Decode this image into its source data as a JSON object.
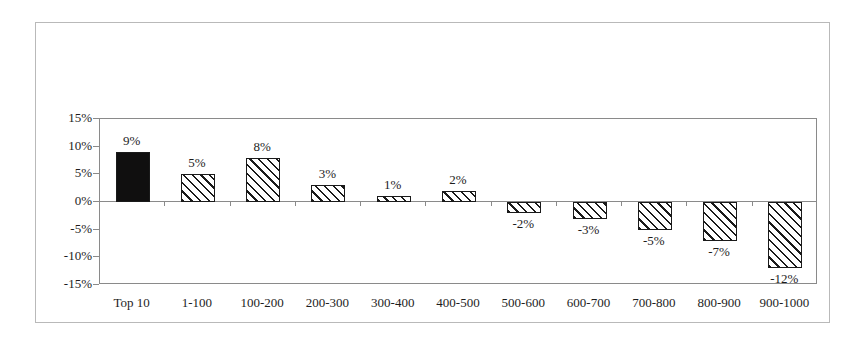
{
  "chart_data": {
    "type": "bar",
    "title": "",
    "subtitle": "",
    "xlabel": "",
    "ylabel": "",
    "categories": [
      "Top 10",
      "1-100",
      "100-200",
      "200-300",
      "300-400",
      "400-500",
      "500-600",
      "600-700",
      "700-800",
      "800-900",
      "900-1000"
    ],
    "values": [
      9,
      5,
      8,
      3,
      1,
      2,
      -2,
      -3,
      -5,
      -7,
      -12
    ],
    "data_labels": [
      "9%",
      "5%",
      "8%",
      "3%",
      "1%",
      "2%",
      "-2%",
      "-3%",
      "-5%",
      "-7%",
      "-12%"
    ],
    "value_unit": "%",
    "ylim": [
      -15,
      15
    ],
    "ytick_values": [
      15,
      10,
      5,
      0,
      -5,
      -10,
      -15
    ],
    "ytick_labels": [
      "15%",
      "10%",
      "5%",
      "0%",
      "-5%",
      "-10%",
      "-15%"
    ],
    "grid": false,
    "legend": null,
    "legend_position": "none",
    "bar_styles": [
      "solid",
      "hatch",
      "hatch",
      "hatch",
      "hatch",
      "hatch",
      "hatch",
      "hatch",
      "hatch",
      "hatch",
      "hatch"
    ],
    "colors": {
      "solid_fill": "#100f0f",
      "hatch_line": "#1a1a1a",
      "hatch_background": "#ffffff",
      "bar_border": "#1a1a1a",
      "axis": "#8a8a8a",
      "text": "#1d1d1d",
      "outer_frame": "#b9b9b9",
      "plot_background": "#ffffff"
    }
  }
}
